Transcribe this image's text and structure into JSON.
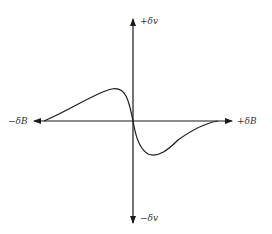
{
  "diagram": {
    "type": "derivative-absorption-signal",
    "axes": {
      "x_positive_label": "+δB",
      "x_negative_label": "−δB",
      "y_positive_label": "+δv",
      "y_negative_label": "−δv"
    },
    "curve": {
      "description": "first-derivative lineshape: positive lobe on -δB side, negative lobe on +δB side, crossing zero at origin"
    },
    "colors": {
      "ink": "#1a1a1a",
      "background": "#ffffff"
    }
  }
}
